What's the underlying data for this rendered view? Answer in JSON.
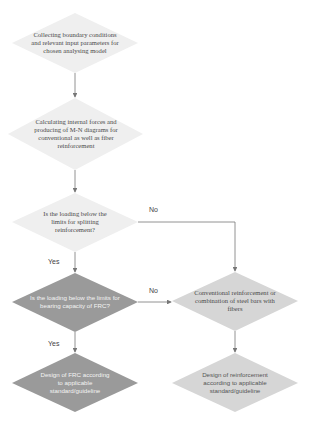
{
  "colors": {
    "very_light": "#efefef",
    "light": "#d6d6d6",
    "dark": "#9a9a9a",
    "line": "#777777"
  },
  "nodes": {
    "collect": "Collecting boundary conditions and relevant input parameters for chosen analysing model",
    "calculate": "Calculating internal forces and producing of M-N diagrams for conventional as well as fiber reinforcement",
    "splitting_question": "Is the loading below the limits for splitting reinforcement?",
    "frc_question": "Is the loading below the limits for bearing capacity of FRC?",
    "conventional": "Conventional reinforcement or combination of steel bars with fibers",
    "design_frc": "Design of FRC according to applicable standard/guideline",
    "design_reinforcement": "Design of reinforcement according to applicable standard/guideline"
  },
  "edge_labels": {
    "splitting_no": "No",
    "splitting_yes": "Yes",
    "frc_no": "No",
    "frc_yes": "Yes"
  }
}
